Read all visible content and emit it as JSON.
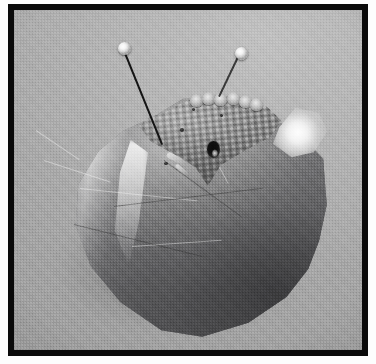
{
  "image": {
    "kind": "photograph",
    "subject": "mineral-specimen-with-two-pins",
    "rendering": "grayscale halftone print",
    "alt_text": "Black-framed grayscale halftone photograph of a rounded mineral specimen on a plain gray background, with a triangular reticulated crystal face on top, a dark bore hole, and two ball-headed pins inserted.",
    "frame": {
      "border_color": "#0a0a0a",
      "border_width_px": 6,
      "outer_margin_color": "#fdfdfd",
      "photo_width_px": 348,
      "photo_height_px": 340
    },
    "palette": {
      "page_white": "#fdfdfd",
      "frame_black": "#0a0a0a",
      "background_gray": "#b2b2b2",
      "background_gray_dark": "#a2a2a2",
      "specimen_midtone": "#8f8f8f",
      "specimen_shadow": "#6b6b6d",
      "specular_highlight": "#ffffff",
      "patch_midtone": "#8f8f8f",
      "bore_hole_black": "#0b0b0b",
      "pin_head_white": "#f4f4f4",
      "pin_shaft_black": "#141414"
    },
    "elements": {
      "background_label": "studio backdrop",
      "specimen_label": "mineral specimen",
      "cast_shadow_label": "cast shadow",
      "patch_label": "reticulated crystal face",
      "bore_hole_label": "dark bore hole",
      "specular_label": "specular highlight",
      "scallop_label": "crystal terminations",
      "pin_left_label": "left marker pin",
      "pin_right_label": "right marker pin"
    },
    "pins": [
      {
        "id": "left",
        "head_center": [
          124,
          48
        ],
        "head_diameter_px": 13,
        "tip": [
          163,
          144
        ],
        "shaft_length_px": 104,
        "shaft_angle_deg": 68,
        "shaft_width_px": 2
      },
      {
        "id": "right",
        "head_center": [
          241,
          53
        ],
        "head_diameter_px": 13,
        "tip": [
          220,
          97
        ],
        "shaft_length_px": 49,
        "shaft_angle_deg": 115,
        "shaft_width_px": 1.5
      }
    ],
    "scallops": [
      {
        "x": 0,
        "y": 2
      },
      {
        "x": 12,
        "y": 0
      },
      {
        "x": 24,
        "y": 1
      },
      {
        "x": 37,
        "y": 0
      },
      {
        "x": 49,
        "y": 3
      },
      {
        "x": 60,
        "y": 6
      }
    ],
    "facet_lines": [
      {
        "x": 30,
        "y": 150,
        "len": 70,
        "rot": 18,
        "tone": "light"
      },
      {
        "x": 22,
        "y": 120,
        "len": 52,
        "rot": 34,
        "tone": "light"
      },
      {
        "x": 66,
        "y": 178,
        "len": 118,
        "rot": 6,
        "tone": "light"
      },
      {
        "x": 100,
        "y": 196,
        "len": 150,
        "rot": -7,
        "tone": "dark"
      },
      {
        "x": 150,
        "y": 150,
        "len": 96,
        "rot": 36,
        "tone": "dark"
      },
      {
        "x": 186,
        "y": 120,
        "len": 60,
        "rot": 62,
        "tone": "light"
      },
      {
        "x": 60,
        "y": 214,
        "len": 132,
        "rot": 14,
        "tone": "dark"
      },
      {
        "x": 118,
        "y": 236,
        "len": 90,
        "rot": -4,
        "tone": "light"
      },
      {
        "x": 210,
        "y": 104,
        "len": 44,
        "rot": 78,
        "tone": "dark"
      }
    ],
    "small_pits": [
      {
        "x": 166,
        "y": 118,
        "w": 4,
        "h": 4
      },
      {
        "x": 150,
        "y": 152,
        "w": 4,
        "h": 3
      },
      {
        "x": 206,
        "y": 104,
        "w": 3,
        "h": 3
      },
      {
        "x": 178,
        "y": 98,
        "w": 3,
        "h": 3
      }
    ]
  }
}
